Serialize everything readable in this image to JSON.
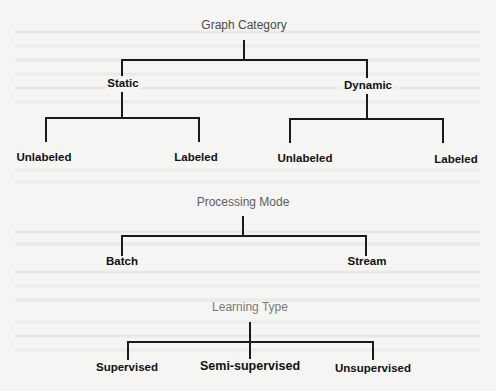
{
  "diagram": {
    "type": "taxonomy-tree",
    "trees": [
      {
        "root": "Graph Category",
        "children": [
          {
            "label": "Static",
            "children": [
              {
                "label": "Unlabeled"
              },
              {
                "label": "Labeled"
              }
            ]
          },
          {
            "label": "Dynamic",
            "children": [
              {
                "label": "Unlabeled"
              },
              {
                "label": "Labeled"
              }
            ]
          }
        ]
      },
      {
        "root": "Processing Mode",
        "children": [
          {
            "label": "Batch"
          },
          {
            "label": "Stream"
          }
        ]
      },
      {
        "root": "Learning Type",
        "children": [
          {
            "label": "Supervised"
          },
          {
            "label": "Semi-supervised"
          },
          {
            "label": "Unsupervised"
          }
        ]
      }
    ]
  },
  "colors": {
    "background": "#f5f5f3",
    "lines": "#1a1a1a",
    "root_text": "#4a4a4a",
    "leaf_text": "#111111"
  }
}
